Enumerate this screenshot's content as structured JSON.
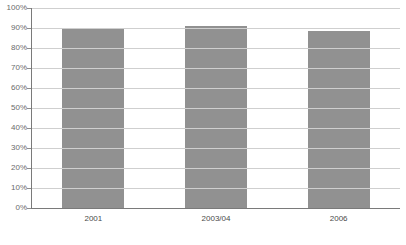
{
  "chart_data": {
    "type": "bar",
    "title": "",
    "subtitle": "",
    "xlabel": "",
    "ylabel": "",
    "categories": [
      "2001",
      "2003/04",
      "2006"
    ],
    "values": [
      90,
      91,
      88.5
    ],
    "ylim": [
      0,
      100
    ],
    "ytick_labels": [
      "0%",
      "10%",
      "20%",
      "30%",
      "40%",
      "50%",
      "60%",
      "70%",
      "80%",
      "90%",
      "100%"
    ],
    "ytick_values": [
      0,
      10,
      20,
      30,
      40,
      50,
      60,
      70,
      80,
      90,
      100
    ],
    "grid": true,
    "legend": false,
    "legend_position": "none",
    "series": [
      {
        "name": "",
        "values": [
          90,
          91,
          88.5
        ],
        "color": "#919191"
      }
    ],
    "colors": {
      "bar": "#919191",
      "gridline": "#cfcfcf",
      "axis": "#7a7a7a",
      "ylabel_text": "#6b6b6b",
      "xlabel_text": "#4a4a4a",
      "background": "#ffffff"
    }
  }
}
